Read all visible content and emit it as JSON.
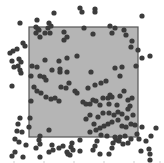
{
  "chart_data": {
    "type": "scatter",
    "title": "",
    "xlabel": "",
    "ylabel": "",
    "region": {
      "x0": 29,
      "y0": 27,
      "x1": 138,
      "y1": 137,
      "fill": "#b5b5b5",
      "stroke": "#555555"
    },
    "marker": {
      "color": "#3c3c3c",
      "radius": 2.6
    },
    "points": [
      [
        20,
        23
      ],
      [
        37,
        20
      ],
      [
        49,
        23
      ],
      [
        54,
        13
      ],
      [
        48,
        28
      ],
      [
        51,
        26
      ],
      [
        36,
        33
      ],
      [
        39,
        30
      ],
      [
        40,
        37
      ],
      [
        45,
        33
      ],
      [
        50,
        33
      ],
      [
        36,
        27
      ],
      [
        38,
        29
      ],
      [
        64,
        32
      ],
      [
        64,
        40
      ],
      [
        67,
        37
      ],
      [
        80,
        8
      ],
      [
        82,
        12
      ],
      [
        95,
        9
      ],
      [
        95,
        12
      ],
      [
        110,
        26
      ],
      [
        115,
        28
      ],
      [
        112,
        33
      ],
      [
        124,
        30
      ],
      [
        142,
        16
      ],
      [
        84,
        28
      ],
      [
        93,
        34
      ],
      [
        126,
        35
      ],
      [
        131,
        47
      ],
      [
        132,
        41
      ],
      [
        138,
        50
      ],
      [
        150,
        56
      ],
      [
        142,
        58
      ],
      [
        115,
        68
      ],
      [
        122,
        67
      ],
      [
        136,
        66
      ],
      [
        120,
        76
      ],
      [
        23,
        43
      ],
      [
        25,
        46
      ],
      [
        17,
        49
      ],
      [
        13,
        51
      ],
      [
        10,
        53
      ],
      [
        12,
        61
      ],
      [
        14,
        67
      ],
      [
        19,
        59
      ],
      [
        21,
        62
      ],
      [
        18,
        66
      ],
      [
        20,
        70
      ],
      [
        21,
        73
      ],
      [
        32,
        66
      ],
      [
        37,
        67
      ],
      [
        40,
        76
      ],
      [
        44,
        77
      ],
      [
        46,
        80
      ],
      [
        52,
        70
      ],
      [
        60,
        69
      ],
      [
        67,
        72
      ],
      [
        45,
        60
      ],
      [
        59,
        61
      ],
      [
        67,
        58
      ],
      [
        77,
        56
      ],
      [
        91,
        72
      ],
      [
        12,
        86
      ],
      [
        31,
        76
      ],
      [
        31,
        101
      ],
      [
        34,
        87
      ],
      [
        37,
        91
      ],
      [
        41,
        93
      ],
      [
        46,
        97
      ],
      [
        51,
        99
      ],
      [
        55,
        98
      ],
      [
        59,
        101
      ],
      [
        60,
        72
      ],
      [
        69,
        83
      ],
      [
        61,
        87
      ],
      [
        66,
        88
      ],
      [
        75,
        91
      ],
      [
        77,
        93
      ],
      [
        88,
        88
      ],
      [
        95,
        85
      ],
      [
        101,
        83
      ],
      [
        106,
        81
      ],
      [
        110,
        95
      ],
      [
        108,
        98
      ],
      [
        83,
        102
      ],
      [
        86,
        104
      ],
      [
        90,
        104
      ],
      [
        93,
        100
      ],
      [
        96,
        101
      ],
      [
        100,
        105
      ],
      [
        103,
        98
      ],
      [
        109,
        104
      ],
      [
        112,
        97
      ],
      [
        117,
        105
      ],
      [
        120,
        96
      ],
      [
        124,
        91
      ],
      [
        128,
        100
      ],
      [
        132,
        98
      ],
      [
        130,
        106
      ],
      [
        128,
        109
      ],
      [
        103,
        113
      ],
      [
        109,
        113
      ],
      [
        114,
        115
      ],
      [
        118,
        112
      ],
      [
        122,
        114
      ],
      [
        127,
        118
      ],
      [
        133,
        115
      ],
      [
        86,
        119
      ],
      [
        90,
        115
      ],
      [
        94,
        124
      ],
      [
        98,
        117
      ],
      [
        100,
        128
      ],
      [
        104,
        126
      ],
      [
        108,
        124
      ],
      [
        112,
        122
      ],
      [
        118,
        120
      ],
      [
        122,
        126
      ],
      [
        126,
        127
      ],
      [
        131,
        124
      ],
      [
        135,
        125
      ],
      [
        125,
        136
      ],
      [
        115,
        137
      ],
      [
        120,
        137
      ],
      [
        90,
        132
      ],
      [
        96,
        130
      ],
      [
        101,
        135
      ],
      [
        107,
        136
      ],
      [
        97,
        141
      ],
      [
        113,
        143
      ],
      [
        116,
        140
      ],
      [
        119,
        141
      ],
      [
        123,
        144
      ],
      [
        128,
        143
      ],
      [
        131,
        139
      ],
      [
        137,
        134
      ],
      [
        142,
        127
      ],
      [
        141,
        151
      ],
      [
        146,
        141
      ],
      [
        139,
        139
      ],
      [
        156,
        128
      ],
      [
        149,
        149
      ],
      [
        151,
        136
      ],
      [
        112,
        148
      ],
      [
        95,
        146
      ],
      [
        80,
        140
      ],
      [
        72,
        143
      ],
      [
        71,
        147
      ],
      [
        40,
        144
      ],
      [
        40,
        136
      ],
      [
        39,
        140
      ],
      [
        30,
        118
      ],
      [
        29,
        127
      ],
      [
        20,
        118
      ],
      [
        18,
        124
      ],
      [
        17,
        131
      ],
      [
        22,
        132
      ],
      [
        15,
        139
      ],
      [
        19,
        142
      ],
      [
        23,
        157
      ],
      [
        26,
        145
      ],
      [
        12,
        156
      ],
      [
        15,
        152
      ],
      [
        36,
        148
      ],
      [
        49,
        130
      ],
      [
        53,
        150
      ],
      [
        67,
        152
      ],
      [
        70,
        155
      ],
      [
        73,
        150
      ],
      [
        63,
        146
      ],
      [
        40,
        157
      ],
      [
        49,
        152
      ],
      [
        52,
        145
      ],
      [
        59,
        148
      ],
      [
        68,
        154
      ],
      [
        80,
        151
      ],
      [
        93,
        150
      ],
      [
        100,
        154
      ],
      [
        109,
        154
      ],
      [
        150,
        154
      ],
      [
        150,
        160
      ]
    ]
  }
}
